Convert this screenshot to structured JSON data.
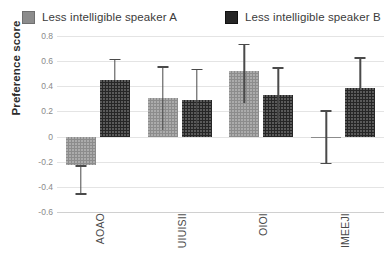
{
  "legend": {
    "position": "top-left",
    "entries": [
      {
        "label": "Less intelligible speaker A",
        "key": "speaker_a",
        "color": "#8c8c8c",
        "swatch": "light-gray-square-icon"
      },
      {
        "label": "Less intelligible speaker B",
        "key": "speaker_b",
        "color": "#262626",
        "swatch": "dark-gray-square-icon"
      }
    ]
  },
  "axes": {
    "y_title": "Preference score",
    "y_ticks": [
      "0.8",
      "0.6",
      "0.4",
      "0.2",
      "0",
      "-0.2",
      "-0.4",
      "-0.6"
    ],
    "x_title": ""
  },
  "chart_data": {
    "type": "bar",
    "title": "",
    "xlabel": "",
    "ylabel": "Preference score",
    "ylim": [
      -0.6,
      0.8
    ],
    "ytick_values": [
      0.8,
      0.6,
      0.4,
      0.2,
      0,
      -0.2,
      -0.4,
      -0.6
    ],
    "grid": true,
    "legend_position": "top-left",
    "categories": [
      "AOAO",
      "UIUISII",
      "OIOI",
      "IMEEJI"
    ],
    "series": [
      {
        "name": "Less intelligible speaker A",
        "color": "#8c8c8c",
        "values": [
          -0.23,
          0.31,
          0.52,
          0.0
        ],
        "error_low": [
          -0.45,
          0.05,
          0.27,
          -0.21
        ],
        "error_high": [
          -0.23,
          0.56,
          0.74,
          0.21
        ]
      },
      {
        "name": "Less intelligible speaker B",
        "color": "#262626",
        "values": [
          0.45,
          0.29,
          0.33,
          0.39
        ],
        "error_low": [
          0.45,
          0.07,
          0.11,
          0.39
        ],
        "error_high": [
          0.62,
          0.54,
          0.55,
          0.63
        ]
      }
    ]
  }
}
